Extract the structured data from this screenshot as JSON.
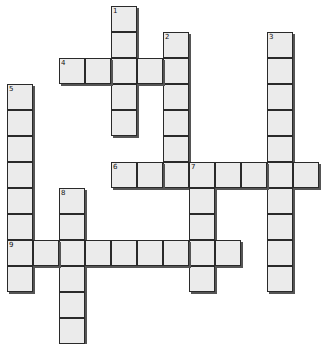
{
  "puzzle": {
    "origin_x": 7,
    "origin_y": 6,
    "cell_pitch": 26,
    "colors": {
      "cell_fill": "#ebebeb",
      "cell_border": "#2a2a2a",
      "shadow": "#555555",
      "background": "#ffffff"
    },
    "words": [
      {
        "number": "1",
        "direction": "down",
        "row": 0,
        "col": 4,
        "length": 5
      },
      {
        "number": "2",
        "direction": "down",
        "row": 1,
        "col": 6,
        "length": 6
      },
      {
        "number": "3",
        "direction": "down",
        "row": 1,
        "col": 10,
        "length": 10
      },
      {
        "number": "4",
        "direction": "across",
        "row": 2,
        "col": 2,
        "length": 5
      },
      {
        "number": "5",
        "direction": "down",
        "row": 3,
        "col": 0,
        "length": 8
      },
      {
        "number": "6",
        "direction": "across",
        "row": 6,
        "col": 4,
        "length": 8
      },
      {
        "number": "7",
        "direction": "down",
        "row": 6,
        "col": 7,
        "length": 5
      },
      {
        "number": "8",
        "direction": "down",
        "row": 7,
        "col": 2,
        "length": 6
      },
      {
        "number": "9",
        "direction": "across",
        "row": 9,
        "col": 0,
        "length": 9
      }
    ]
  }
}
